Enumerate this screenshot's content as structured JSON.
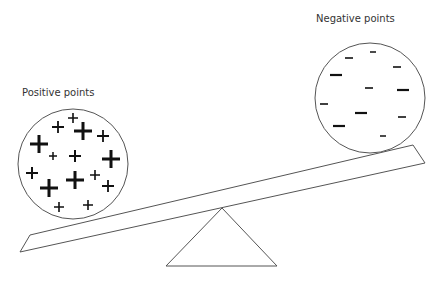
{
  "labels": {
    "positive": "Positive points",
    "negative": "Negative points"
  },
  "colors": {
    "stroke": "#555555",
    "symbol": "#111111",
    "label": "#333333",
    "background": "#ffffff"
  },
  "positive_circle": {
    "cx": 73,
    "cy": 164,
    "r": 55,
    "symbols": [
      {
        "x": 73,
        "y": 118,
        "s": 5,
        "w": 1.6
      },
      {
        "x": 58,
        "y": 127,
        "s": 6,
        "w": 1.8
      },
      {
        "x": 83,
        "y": 131,
        "s": 9,
        "w": 3
      },
      {
        "x": 103,
        "y": 136,
        "s": 6,
        "w": 1.8
      },
      {
        "x": 39,
        "y": 144,
        "s": 9,
        "w": 3
      },
      {
        "x": 53,
        "y": 156,
        "s": 4,
        "w": 1.5
      },
      {
        "x": 75,
        "y": 156,
        "s": 6,
        "w": 2
      },
      {
        "x": 111,
        "y": 159,
        "s": 9,
        "w": 3
      },
      {
        "x": 32,
        "y": 173,
        "s": 6,
        "w": 2
      },
      {
        "x": 49,
        "y": 188,
        "s": 9,
        "w": 3
      },
      {
        "x": 75,
        "y": 180,
        "s": 9,
        "w": 3
      },
      {
        "x": 95,
        "y": 175,
        "s": 5,
        "w": 1.6
      },
      {
        "x": 108,
        "y": 186,
        "s": 6,
        "w": 1.8
      },
      {
        "x": 59,
        "y": 207,
        "s": 5,
        "w": 1.6
      },
      {
        "x": 88,
        "y": 205,
        "s": 5,
        "w": 1.6
      }
    ]
  },
  "negative_circle": {
    "cx": 370,
    "cy": 98,
    "r": 55,
    "symbols": [
      {
        "x": 373,
        "y": 52,
        "s": 3,
        "w": 1.5
      },
      {
        "x": 349,
        "y": 58,
        "s": 4,
        "w": 1.6
      },
      {
        "x": 397,
        "y": 67,
        "s": 4,
        "w": 1.6
      },
      {
        "x": 336,
        "y": 75,
        "s": 6,
        "w": 2.2
      },
      {
        "x": 369,
        "y": 88,
        "s": 4,
        "w": 1.6
      },
      {
        "x": 403,
        "y": 90,
        "s": 6,
        "w": 2.2
      },
      {
        "x": 324,
        "y": 104,
        "s": 4,
        "w": 1.6
      },
      {
        "x": 361,
        "y": 113,
        "s": 6,
        "w": 2.2
      },
      {
        "x": 402,
        "y": 117,
        "s": 4,
        "w": 1.6
      },
      {
        "x": 339,
        "y": 126,
        "s": 6,
        "w": 2.2
      },
      {
        "x": 383,
        "y": 136,
        "s": 3,
        "w": 1.5
      }
    ]
  },
  "plank": {
    "points": "20,252 30,235 413,145 425,163"
  },
  "fulcrum": {
    "points": "222,208 166,266 277,266"
  }
}
